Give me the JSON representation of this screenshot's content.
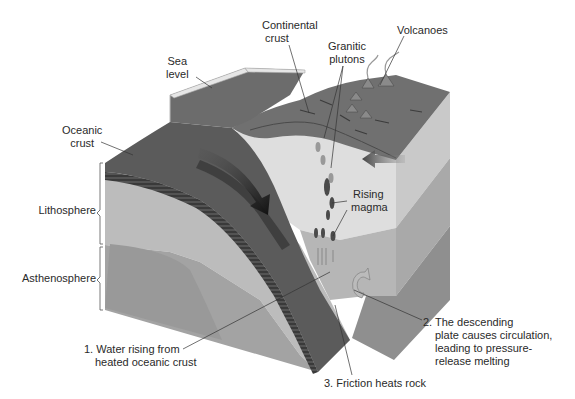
{
  "labels": {
    "continental_crust": [
      "Continental",
      "crust"
    ],
    "granitic_plutons": [
      "Granitic",
      "plutons"
    ],
    "volcanoes": "Volcanoes",
    "sea_level": [
      "Sea",
      "level"
    ],
    "oceanic_crust": [
      "Oceanic",
      "crust"
    ],
    "rising_magma": [
      "Rising",
      "magma"
    ],
    "lithosphere": "Lithosphere",
    "asthenosphere": "Asthenosphere"
  },
  "annotations": {
    "step1": [
      "1. Water rising from",
      "heated oceanic crust"
    ],
    "step2": [
      "2. The descending",
      "plate causes circulation,",
      "leading to pressure-",
      "release melting"
    ],
    "step3": "3. Friction heats rock"
  },
  "colors": {
    "oceanic_plate": "#5a5a5a",
    "slab_dark": "#3e3e3e",
    "lithosphere": "#b9b9b9",
    "asthenosphere": "#9c9c9c",
    "continental_light": "#d9d9d9",
    "continental_surface": "#6f6f6f",
    "sea_water": "#7a7a7a",
    "right_face_upper": "#a8a8a8",
    "right_face_lower": "#8e8e8e",
    "arrow": "#2a2a2a",
    "text": "#2a2a2a"
  },
  "icons": [
    "subduction-arrow-icon",
    "convergence-arrow-icon",
    "circulation-arrow-icon",
    "magma-blob-icon",
    "volcano-smoke-icon"
  ]
}
